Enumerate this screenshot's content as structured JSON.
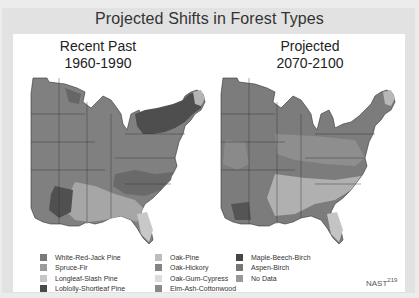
{
  "title": "Projected Shifts in Forest Types",
  "maps": {
    "left": {
      "line1": "Recent Past",
      "line2": "1960-1990"
    },
    "right": {
      "line1": "Projected",
      "line2": "2070-2100"
    }
  },
  "legend": {
    "col1": [
      {
        "label": "White-Red-Jack Pine",
        "color": "#7a7a7a"
      },
      {
        "label": "Spruce-Fir",
        "color": "#9c9c9c"
      },
      {
        "label": "Longleaf-Slash Pine",
        "color": "#c6c6c6"
      },
      {
        "label": "Loblolly-Shortleaf Pine",
        "color": "#4a4a4a"
      }
    ],
    "col2": [
      {
        "label": "Oak-Pine",
        "color": "#bdbdbd"
      },
      {
        "label": "Oak-Hickory",
        "color": "#858585"
      },
      {
        "label": "Oak-Gum-Cypress",
        "color": "#dcdcdc"
      },
      {
        "label": "Elm-Ash-Cottonwood",
        "color": "#8a8a8a"
      }
    ],
    "col3": [
      {
        "label": "Maple-Beech-Birch",
        "color": "#464646"
      },
      {
        "label": "Aspen-Birch",
        "color": "#777777"
      },
      {
        "label": "No Data",
        "color": "#999999"
      }
    ]
  },
  "source": {
    "label": "NAST",
    "page": "219"
  }
}
